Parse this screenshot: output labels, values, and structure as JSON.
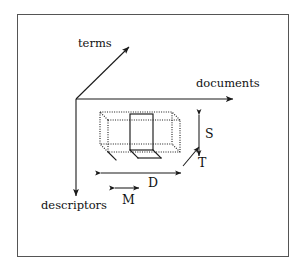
{
  "figure": {
    "kind": "3d-axis-block-diagram",
    "background_color": "#ffffff",
    "line_color": "#1a1a1a",
    "frame_color": "#555555",
    "frame": {
      "x": 17,
      "y": 14,
      "width": 272,
      "height": 243
    }
  },
  "axes": {
    "origin": {
      "x": 76,
      "y": 99
    },
    "terms": {
      "label": "terms",
      "icon": "arrow-up-right-icon",
      "from": {
        "x": 76,
        "y": 99
      },
      "to": {
        "x": 129,
        "y": 47
      }
    },
    "documents": {
      "label": "documents",
      "icon": "arrow-right-icon",
      "from": {
        "x": 76,
        "y": 99
      },
      "to": {
        "x": 233,
        "y": 99
      }
    },
    "descriptors": {
      "label": "descriptors",
      "icon": "arrow-down-icon",
      "from": {
        "x": 76,
        "y": 99
      },
      "to": {
        "x": 76,
        "y": 196
      }
    }
  },
  "block": {
    "style": "dotted",
    "front_face": {
      "x": 108,
      "y": 120,
      "width": 72,
      "height": 32
    },
    "depth_offset": {
      "dx": -8,
      "dy": -8
    },
    "slab": {
      "style": "solid",
      "x": 130,
      "y": 114,
      "width": 23,
      "height": 36,
      "note": "highlighted solid vertical slab inside the dotted block"
    }
  },
  "dimensions": [
    {
      "name": "S",
      "label": "S",
      "icon": "double-arrow-vertical-icon",
      "orientation": "vertical",
      "from": {
        "x": 199,
        "y": 114
      },
      "to": {
        "x": 199,
        "y": 156
      }
    },
    {
      "name": "T",
      "label": "T",
      "icon": "arrow-up-right-icon",
      "orientation": "diagonal",
      "from": {
        "x": 183,
        "y": 166
      },
      "to": {
        "x": 199,
        "y": 147
      }
    },
    {
      "name": "D",
      "label": "D",
      "icon": "double-arrow-horizontal-icon",
      "orientation": "horizontal",
      "from": {
        "x": 101,
        "y": 173
      },
      "to": {
        "x": 180,
        "y": 173
      }
    },
    {
      "name": "M",
      "label": "M",
      "icon": "double-arrow-horizontal-icon",
      "orientation": "horizontal",
      "from": {
        "x": 114,
        "y": 188
      },
      "to": {
        "x": 139,
        "y": 188
      }
    }
  ]
}
